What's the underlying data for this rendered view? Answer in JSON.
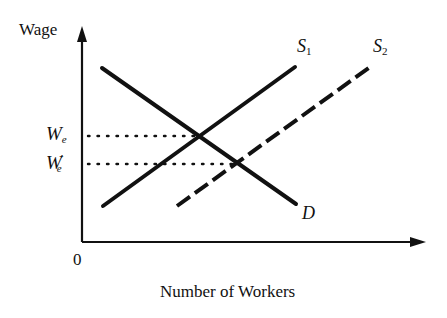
{
  "diagram": {
    "y_axis_label": "Wage",
    "x_axis_label": "Number of Workers",
    "origin_label": "0",
    "curves": [
      {
        "name": "S",
        "subscript": "1",
        "style": "solid",
        "role": "original labor supply"
      },
      {
        "name": "S",
        "subscript": "2",
        "style": "dashed",
        "role": "increased labor supply"
      },
      {
        "name": "D",
        "subscript": "",
        "style": "solid",
        "role": "labor demand"
      }
    ],
    "wage_levels": [
      {
        "name": "W",
        "subscript": "e",
        "prime": "",
        "description": "equilibrium wage at S1 and D"
      },
      {
        "name": "W",
        "subscript": "e",
        "prime": "′",
        "description": "equilibrium wage at S2 and D"
      }
    ],
    "colors": {
      "ink": "#111111",
      "background": "#ffffff"
    }
  }
}
